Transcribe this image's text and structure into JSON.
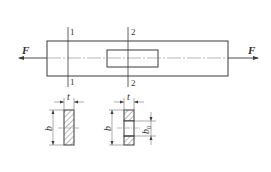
{
  "diagram": {
    "type": "engineering-drawing",
    "colors": {
      "line": "#3a3a3a",
      "hatch": "#555555",
      "background": "#ffffff"
    },
    "main_view": {
      "force_left_label": "F",
      "force_right_label": "F",
      "section1_top_label": "1",
      "section1_bottom_label": "1",
      "section2_top_label": "2",
      "section2_bottom_label": "2"
    },
    "section_1": {
      "name": "Section 1-1",
      "thickness_label": "t",
      "width_label": "b"
    },
    "section_2": {
      "name": "Section 2-2",
      "thickness_label": "t",
      "width_label": "b",
      "hole_width_label": "b",
      "hole_width_subscript": "0"
    }
  }
}
